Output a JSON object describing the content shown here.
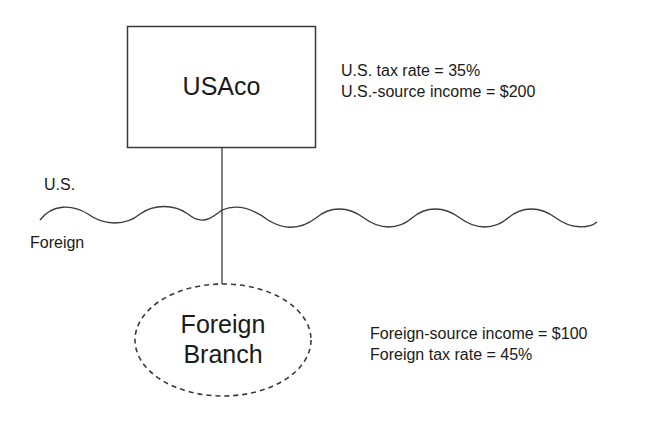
{
  "parent": {
    "name": "USAco",
    "facts": [
      "U.S. tax rate = 35%",
      "U.S.-source income = $200"
    ]
  },
  "border": {
    "upper_label": "U.S.",
    "lower_label": "Foreign"
  },
  "branch": {
    "name_line1": "Foreign",
    "name_line2": "Branch",
    "facts": [
      "Foreign-source income = $100",
      "Foreign tax rate = 45%"
    ]
  },
  "colors": {
    "stroke": "#3a3a3a",
    "text": "#1a1a1a"
  }
}
